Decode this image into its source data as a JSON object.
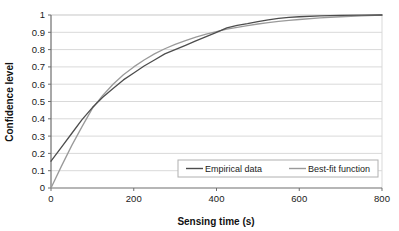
{
  "chart_data": {
    "type": "line",
    "title": "",
    "xlabel": "Sensing time (s)",
    "ylabel": "Confidence level",
    "xlim": [
      0,
      800
    ],
    "ylim": [
      0,
      1
    ],
    "grid": "horizontal",
    "legend_position": "inside-bottom-center",
    "xticks": [
      "0",
      "200",
      "400",
      "600",
      "800"
    ],
    "xtick_values": [
      0,
      200,
      400,
      600,
      800
    ],
    "yticks": [
      "0",
      "0.1",
      "0.2",
      "0.3",
      "0.4",
      "0.5",
      "0.6",
      "0.7",
      "0.8",
      "0.9",
      "1"
    ],
    "ytick_values": [
      0,
      0.1,
      0.2,
      0.3,
      0.4,
      0.5,
      0.6,
      0.7,
      0.8,
      0.9,
      1
    ],
    "x": [
      0,
      25,
      50,
      75,
      100,
      125,
      150,
      175,
      200,
      225,
      250,
      275,
      300,
      325,
      350,
      375,
      400,
      425,
      450,
      475,
      500,
      525,
      550,
      575,
      600,
      650,
      700,
      750,
      800
    ],
    "series": [
      {
        "name": "Empirical data",
        "color": "#4d4d4d",
        "values": [
          0.155,
          0.235,
          0.315,
          0.395,
          0.465,
          0.525,
          0.575,
          0.625,
          0.665,
          0.705,
          0.74,
          0.775,
          0.8,
          0.825,
          0.85,
          0.875,
          0.9,
          0.925,
          0.94,
          0.95,
          0.962,
          0.972,
          0.98,
          0.986,
          0.99,
          0.995,
          0.998,
          0.999,
          1.0
        ]
      },
      {
        "name": "Best-fit function",
        "color": "#9a9a9a",
        "values": [
          0.0,
          0.125,
          0.245,
          0.355,
          0.46,
          0.535,
          0.6,
          0.655,
          0.7,
          0.74,
          0.775,
          0.805,
          0.83,
          0.852,
          0.872,
          0.889,
          0.904,
          0.918,
          0.929,
          0.939,
          0.948,
          0.956,
          0.963,
          0.969,
          0.974,
          0.983,
          0.99,
          0.995,
          1.0
        ]
      }
    ],
    "legend": [
      {
        "label": "Empirical data",
        "color": "#4d4d4d"
      },
      {
        "label": "Best-fit function",
        "color": "#9a9a9a"
      }
    ],
    "plot_area": {
      "left": 51,
      "top": 15,
      "right": 382,
      "bottom": 188
    },
    "colors": {
      "gridline": "#d9d9d9",
      "axis": "#808080",
      "legend_border": "#b0b0b0",
      "background": "#ffffff"
    }
  }
}
